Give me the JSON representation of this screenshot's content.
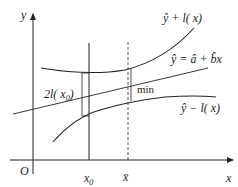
{
  "diagram": {
    "type": "regression-prediction-band",
    "axes": {
      "y_label": "y",
      "x_label": "x",
      "origin_label": "O"
    },
    "x_ticks": {
      "x0": {
        "label": "x",
        "sub": "0"
      },
      "xbar": {
        "label": "x̄"
      }
    },
    "curves": {
      "upper": {
        "label_hat": "ŷ",
        "label_rest": " + l( x)"
      },
      "line": {
        "label": "ŷ = â + b̂x"
      },
      "lower": {
        "label_hat": "ŷ",
        "label_rest": " − l( x)"
      }
    },
    "annotations": {
      "width_label_prefix": "2l( x",
      "width_label_sub": "0",
      "width_label_suffix": ")",
      "min_label": "min"
    },
    "colors": {
      "stroke": "#222222",
      "background": "#ffffff"
    }
  }
}
